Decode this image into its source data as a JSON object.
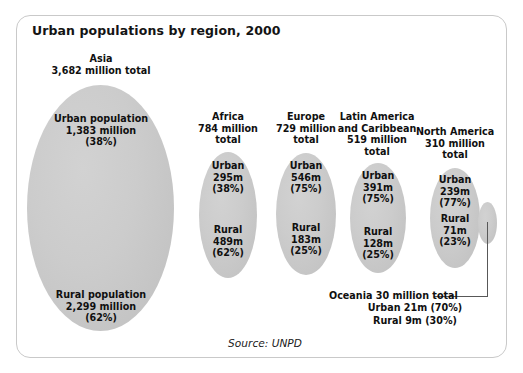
{
  "chart_data": {
    "type": "bar",
    "title": "Urban populations by region, 2000",
    "subtitle": "",
    "xlabel": "",
    "ylabel": "",
    "source": "Source: UNPD",
    "units": "millions of people",
    "categories": [
      "Asia",
      "Africa",
      "Europe",
      "Latin America and Caribbean",
      "North America",
      "Oceania"
    ],
    "series": [
      {
        "name": "Urban",
        "values": [
          1383,
          295,
          546,
          391,
          239,
          21
        ]
      },
      {
        "name": "Rural",
        "values": [
          2299,
          489,
          183,
          128,
          71,
          9
        ]
      },
      {
        "name": "Total",
        "values": [
          3682,
          784,
          729,
          519,
          310,
          30
        ]
      }
    ],
    "urban_percent": [
      38,
      38,
      75,
      75,
      77,
      70
    ],
    "rural_percent": [
      62,
      62,
      25,
      25,
      23,
      30
    ],
    "legend": [
      "Urban",
      "Rural"
    ],
    "legend_position": "none",
    "grid": false
  },
  "title": "Urban populations by region, 2000",
  "source": "Source: UNPD",
  "regions": {
    "asia": {
      "header": "Asia\n3,682 million total",
      "urban": "Urban population\n1,383 million\n(38%)",
      "rural": "Rural population\n2,299 million\n(62%)"
    },
    "africa": {
      "header": "Africa\n784 million\ntotal",
      "urban": "Urban\n295m\n(38%)",
      "rural": "Rural\n489m\n(62%)"
    },
    "europe": {
      "header": "Europe\n729 million\ntotal",
      "urban": "Urban\n546m\n(75%)",
      "rural": "Rural\n183m\n(25%)"
    },
    "latam": {
      "header": "Latin America\nand Caribbean\n519 million\ntotal",
      "urban": "Urban\n391m\n(75%)",
      "rural": "Rural\n128m\n(25%)"
    },
    "namerica": {
      "header": "North America\n310 million\ntotal",
      "urban": "Urban\n239m\n(77%)",
      "rural": "Rural\n71m\n(23%)"
    },
    "oceania": {
      "caption_line1": "Oceania 30 million total",
      "caption_line2": "Urban 21m (70%)",
      "caption_line3": "Rural 9m (30%)"
    }
  },
  "colors": {
    "ellipse_fill": "#cccccc",
    "ellipse_fill_edge": "#bdbdbd",
    "frame_border": "#c9c9c9",
    "text": "#101010",
    "leader_line": "#585858",
    "background": "#ffffff"
  }
}
